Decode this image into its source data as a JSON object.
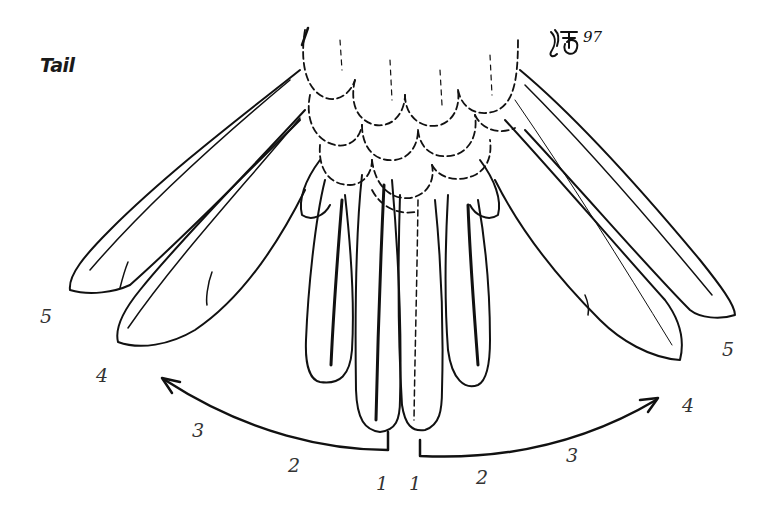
{
  "title": "Tail",
  "signature": {
    "initials": "JFB",
    "year": "97"
  },
  "colors": {
    "ink": "#111111",
    "label": "#333333",
    "background": "#ffffff"
  },
  "feather_labels": {
    "left": [
      {
        "number": "1",
        "x": 376,
        "y": 474
      },
      {
        "number": "2",
        "x": 288,
        "y": 456
      },
      {
        "number": "3",
        "x": 192,
        "y": 421
      },
      {
        "number": "4",
        "x": 96,
        "y": 366
      },
      {
        "number": "5",
        "x": 40,
        "y": 307
      }
    ],
    "right": [
      {
        "number": "1",
        "x": 409,
        "y": 474
      },
      {
        "number": "2",
        "x": 476,
        "y": 468
      },
      {
        "number": "3",
        "x": 566,
        "y": 446
      },
      {
        "number": "4",
        "x": 682,
        "y": 396
      },
      {
        "number": "5",
        "x": 722,
        "y": 340
      }
    ]
  },
  "arrows": {
    "left": {
      "direction": "outward-left",
      "description": "moult sequence arrow from central feather to outer feathers"
    },
    "right": {
      "direction": "outward-right",
      "description": "moult sequence arrow from central feather to outer feathers"
    }
  }
}
